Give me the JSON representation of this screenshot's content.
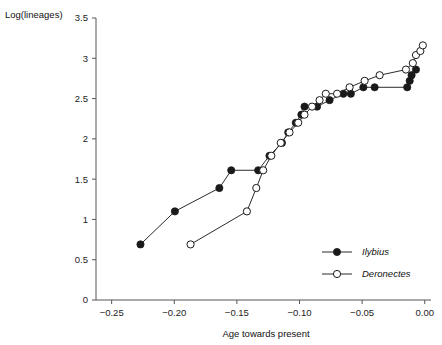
{
  "chart_data": {
    "type": "line",
    "title": "",
    "xlabel": "Age towards present",
    "ylabel": "Log(lineages)",
    "xlim": [
      -0.2625,
      0.005
    ],
    "ylim": [
      0,
      3.5
    ],
    "grid": false,
    "legend_position": "bottom-right",
    "xticks": [
      "-0.25",
      "-0.20",
      "-0.15",
      "-0.10",
      "-0.05",
      "0.00"
    ],
    "xtick_values": [
      -0.25,
      -0.2,
      -0.15,
      -0.1,
      -0.05,
      0.0
    ],
    "yticks": [
      "0",
      "0.5",
      "1",
      "1.5",
      "2",
      "2.5",
      "3",
      "3.5"
    ],
    "ytick_values": [
      0,
      0.5,
      1,
      1.5,
      2,
      2.5,
      3,
      3.5
    ],
    "series": [
      {
        "name": "Ilybius",
        "marker": "filled-circle",
        "color": "#1a1a1a",
        "points": [
          [
            -0.227,
            0.69
          ],
          [
            -0.1995,
            1.1
          ],
          [
            -0.164,
            1.39
          ],
          [
            -0.1545,
            1.61
          ],
          [
            -0.133,
            1.61
          ],
          [
            -0.124,
            1.79
          ],
          [
            -0.114,
            1.95
          ],
          [
            -0.109,
            2.08
          ],
          [
            -0.103,
            2.2
          ],
          [
            -0.0985,
            2.3
          ],
          [
            -0.096,
            2.4
          ],
          [
            -0.086,
            2.4
          ],
          [
            -0.076,
            2.48
          ],
          [
            -0.065,
            2.56
          ],
          [
            -0.059,
            2.56
          ],
          [
            -0.049,
            2.64
          ],
          [
            -0.04,
            2.64
          ],
          [
            -0.014,
            2.64
          ],
          [
            -0.012,
            2.72
          ],
          [
            -0.0105,
            2.79
          ],
          [
            -0.007,
            2.86
          ]
        ]
      },
      {
        "name": "Deronectes",
        "marker": "open-circle",
        "color": "#1a1a1a",
        "points": [
          [
            -0.187,
            0.69
          ],
          [
            -0.142,
            1.1
          ],
          [
            -0.1345,
            1.39
          ],
          [
            -0.129,
            1.61
          ],
          [
            -0.1225,
            1.79
          ],
          [
            -0.115,
            1.95
          ],
          [
            -0.108,
            2.08
          ],
          [
            -0.101,
            2.2
          ],
          [
            -0.096,
            2.3
          ],
          [
            -0.09,
            2.4
          ],
          [
            -0.084,
            2.48
          ],
          [
            -0.079,
            2.56
          ],
          [
            -0.07,
            2.56
          ],
          [
            -0.06,
            2.64
          ],
          [
            -0.048,
            2.72
          ],
          [
            -0.036,
            2.79
          ],
          [
            -0.015,
            2.86
          ],
          [
            -0.0095,
            2.94
          ],
          [
            -0.007,
            3.04
          ],
          [
            -0.0035,
            3.09
          ],
          [
            -0.0015,
            3.16
          ]
        ]
      }
    ],
    "legend": [
      {
        "label": "Ilybius",
        "marker": "filled-circle"
      },
      {
        "label": "Deronectes",
        "marker": "open-circle"
      }
    ]
  }
}
